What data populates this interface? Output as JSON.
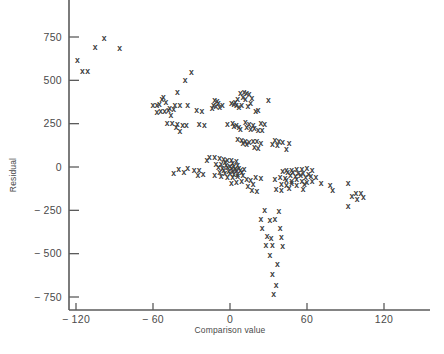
{
  "chart_data": {
    "type": "scatter",
    "title": "",
    "xlabel": "Comparison value",
    "ylabel": "Residual",
    "xlim": [
      -140,
      140
    ],
    "ylim": [
      -830,
      900
    ],
    "grid": false,
    "legend": null,
    "marker": "x",
    "marker_color": "#3c3c3c",
    "xticks": [
      -120,
      -60,
      0,
      60,
      120
    ],
    "xticklabels": [
      "− 120",
      "− 60",
      "0",
      "60",
      "120"
    ],
    "yticks": [
      750,
      500,
      250,
      0,
      -250,
      -500,
      -750
    ],
    "yticklabels": [
      "750",
      "500",
      "250",
      "0",
      "− 250",
      "− 500",
      "− 750"
    ],
    "n_points": 212,
    "points": [
      [
        -98,
        745
      ],
      [
        -105,
        690
      ],
      [
        -86,
        685
      ],
      [
        -119,
        620
      ],
      [
        -115,
        555
      ],
      [
        -111,
        555
      ],
      [
        -30,
        550
      ],
      [
        -35,
        500
      ],
      [
        -41,
        430
      ],
      [
        -52,
        405
      ],
      [
        -53,
        390
      ],
      [
        -50,
        375
      ],
      [
        -55,
        365
      ],
      [
        -57,
        360
      ],
      [
        -60,
        358
      ],
      [
        -43,
        360
      ],
      [
        -39,
        358
      ],
      [
        -33,
        355
      ],
      [
        -47,
        340
      ],
      [
        -44,
        332
      ],
      [
        -48,
        330
      ],
      [
        -51,
        325
      ],
      [
        -54,
        322
      ],
      [
        -57,
        318
      ],
      [
        -46,
        300
      ],
      [
        -26,
        330
      ],
      [
        -22,
        325
      ],
      [
        -12,
        385
      ],
      [
        -10,
        378
      ],
      [
        -9,
        368
      ],
      [
        -13,
        360
      ],
      [
        -11,
        350
      ],
      [
        -8,
        345
      ],
      [
        -14,
        340
      ],
      [
        -6,
        360
      ],
      [
        1,
        370
      ],
      [
        3,
        365
      ],
      [
        5,
        358
      ],
      [
        7,
        345
      ],
      [
        11,
        432
      ],
      [
        13,
        428
      ],
      [
        8,
        425
      ],
      [
        15,
        420
      ],
      [
        10,
        405
      ],
      [
        17,
        400
      ],
      [
        12,
        392
      ],
      [
        6,
        395
      ],
      [
        4,
        375
      ],
      [
        16,
        368
      ],
      [
        9,
        360
      ],
      [
        14,
        352
      ],
      [
        30,
        385
      ],
      [
        22,
        330
      ],
      [
        20,
        322
      ],
      [
        -49,
        255
      ],
      [
        -45,
        252
      ],
      [
        -41,
        248
      ],
      [
        -37,
        245
      ],
      [
        -34,
        240
      ],
      [
        -42,
        230
      ],
      [
        -39,
        205
      ],
      [
        -24,
        250
      ],
      [
        -20,
        245
      ],
      [
        -2,
        248
      ],
      [
        2,
        252
      ],
      [
        5,
        245
      ],
      [
        3,
        235
      ],
      [
        7,
        228
      ],
      [
        8,
        222
      ],
      [
        12,
        258
      ],
      [
        15,
        250
      ],
      [
        18,
        242
      ],
      [
        13,
        228
      ],
      [
        19,
        225
      ],
      [
        16,
        218
      ],
      [
        24,
        255
      ],
      [
        27,
        248
      ],
      [
        22,
        215
      ],
      [
        25,
        212
      ],
      [
        6,
        160
      ],
      [
        9,
        155
      ],
      [
        12,
        150
      ],
      [
        15,
        145
      ],
      [
        10,
        140
      ],
      [
        13,
        135
      ],
      [
        18,
        152
      ],
      [
        21,
        148
      ],
      [
        24,
        140
      ],
      [
        19,
        115
      ],
      [
        22,
        112
      ],
      [
        35,
        155
      ],
      [
        38,
        150
      ],
      [
        41,
        145
      ],
      [
        33,
        135
      ],
      [
        37,
        128
      ],
      [
        46,
        140
      ],
      [
        44,
        105
      ],
      [
        -16,
        60
      ],
      [
        -12,
        55
      ],
      [
        -8,
        50
      ],
      [
        -18,
        40
      ],
      [
        -5,
        48
      ],
      [
        -2,
        42
      ],
      [
        1,
        38
      ],
      [
        -4,
        30
      ],
      [
        2,
        25
      ],
      [
        5,
        32
      ],
      [
        -11,
        20
      ],
      [
        -7,
        15
      ],
      [
        -3,
        12
      ],
      [
        0,
        8
      ],
      [
        3,
        5
      ],
      [
        6,
        10
      ],
      [
        -9,
        0
      ],
      [
        -6,
        -5
      ],
      [
        -2,
        -2
      ],
      [
        1,
        -8
      ],
      [
        4,
        -12
      ],
      [
        7,
        -6
      ],
      [
        -5,
        -18
      ],
      [
        -1,
        -22
      ],
      [
        2,
        -25
      ],
      [
        5,
        -20
      ],
      [
        8,
        -15
      ],
      [
        11,
        -10
      ],
      [
        -8,
        -30
      ],
      [
        -4,
        -35
      ],
      [
        0,
        -32
      ],
      [
        3,
        -40
      ],
      [
        6,
        -38
      ],
      [
        9,
        -28
      ],
      [
        -12,
        -45
      ],
      [
        -7,
        -50
      ],
      [
        -2,
        -55
      ],
      [
        2,
        -58
      ],
      [
        6,
        -52
      ],
      [
        10,
        -45
      ],
      [
        -24,
        -20
      ],
      [
        -28,
        -15
      ],
      [
        -21,
        -40
      ],
      [
        -25,
        -45
      ],
      [
        -33,
        -8
      ],
      [
        -36,
        -28
      ],
      [
        -40,
        -10
      ],
      [
        -44,
        -35
      ],
      [
        13,
        -70
      ],
      [
        16,
        -75
      ],
      [
        9,
        -78
      ],
      [
        5,
        -85
      ],
      [
        1,
        -90
      ],
      [
        18,
        -100
      ],
      [
        14,
        -110
      ],
      [
        20,
        -60
      ],
      [
        24,
        -65
      ],
      [
        17,
        -135
      ],
      [
        21,
        -140
      ],
      [
        44,
        -20
      ],
      [
        48,
        -15
      ],
      [
        52,
        -10
      ],
      [
        56,
        -12
      ],
      [
        60,
        -8
      ],
      [
        64,
        -18
      ],
      [
        41,
        -25
      ],
      [
        45,
        -30
      ],
      [
        49,
        -28
      ],
      [
        53,
        -35
      ],
      [
        57,
        -32
      ],
      [
        61,
        -40
      ],
      [
        47,
        -48
      ],
      [
        51,
        -52
      ],
      [
        55,
        -45
      ],
      [
        59,
        -55
      ],
      [
        63,
        -50
      ],
      [
        67,
        -58
      ],
      [
        43,
        -62
      ],
      [
        39,
        -55
      ],
      [
        35,
        -70
      ],
      [
        44,
        -75
      ],
      [
        48,
        -78
      ],
      [
        52,
        -72
      ],
      [
        56,
        -82
      ],
      [
        60,
        -85
      ],
      [
        64,
        -78
      ],
      [
        40,
        -98
      ],
      [
        44,
        -102
      ],
      [
        48,
        -95
      ],
      [
        52,
        -105
      ],
      [
        58,
        -100
      ],
      [
        36,
        -125
      ],
      [
        40,
        -130
      ],
      [
        46,
        -122
      ],
      [
        57,
        -128
      ],
      [
        71,
        -95
      ],
      [
        78,
        -102
      ],
      [
        80,
        -130
      ],
      [
        92,
        -90
      ],
      [
        98,
        -150
      ],
      [
        102,
        -148
      ],
      [
        95,
        -165
      ],
      [
        99,
        -185
      ],
      [
        104,
        -175
      ],
      [
        92,
        -225
      ],
      [
        27,
        -250
      ],
      [
        38,
        -252
      ],
      [
        24,
        -300
      ],
      [
        31,
        -305
      ],
      [
        35,
        -300
      ],
      [
        25,
        -350
      ],
      [
        39,
        -352
      ],
      [
        29,
        -400
      ],
      [
        32,
        -408
      ],
      [
        40,
        -402
      ],
      [
        28,
        -450
      ],
      [
        33,
        -452
      ],
      [
        41,
        -455
      ],
      [
        31,
        -505
      ],
      [
        37,
        -560
      ],
      [
        33,
        -620
      ],
      [
        36,
        -680
      ],
      [
        34,
        -735
      ]
    ]
  }
}
